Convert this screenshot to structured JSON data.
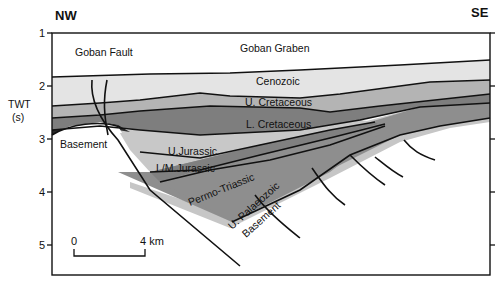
{
  "figure": {
    "direction_left": "NW",
    "direction_right": "SE",
    "y_axis": {
      "label_line1": "TWT",
      "label_line2": "(s)",
      "ticks": [
        "1",
        "2",
        "3",
        "4",
        "5"
      ]
    },
    "scale_bar": {
      "start": "0",
      "end": "4 km"
    },
    "labels": {
      "goban_fault": "Goban Fault",
      "goban_graben": "Goban Graben",
      "cenozoic": "Cenozoic",
      "u_cretaceous": "U. Cretaceous",
      "l_cretaceous": "L. Cretaceous",
      "basement": "Basement",
      "u_jurassic": "U.Jurassic",
      "lm_jurassic": "L/M.Jurassic",
      "permo_triassic": "Permo-Triassic",
      "u_palaeozoic_line1": "U. Palaeozoic",
      "u_palaeozoic_line2": "Basement"
    },
    "colors": {
      "water": "#ffffff",
      "cenozoic": "#e4e4e4",
      "u_cretaceous": "#b4b4b4",
      "l_cretaceous": "#7e7e7e",
      "u_jurassic": "#c8c8c8",
      "lm_jurassic": "#808080",
      "permo_triassic": "#8e8e8e",
      "u_palaeozoic": "#c6c6c6",
      "basement_high": "#2a2a2a",
      "line": "#111111"
    }
  }
}
